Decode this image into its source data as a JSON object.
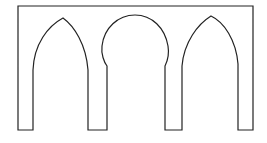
{
  "diagram": {
    "title": "",
    "stroke_color": "#222222",
    "background": "#ffffff",
    "arches": [
      {
        "type": "pointed"
      },
      {
        "type": "horseshoe"
      },
      {
        "type": "pointed"
      }
    ]
  }
}
